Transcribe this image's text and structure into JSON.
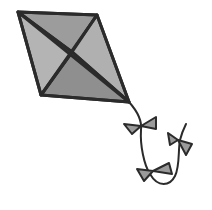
{
  "image": {
    "subject": "kite",
    "description": "Clipart of a gray diamond-shaped kite with crossed spars and a curving tail with three bows",
    "colors": {
      "outline": "#2b2b2b",
      "panel_light": "#a8a8a8",
      "panel_dark": "#909090",
      "bow_fill": "#9a9a9a",
      "background": "#ffffff"
    },
    "bow_count": 3
  }
}
